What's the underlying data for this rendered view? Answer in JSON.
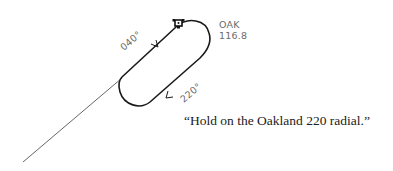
{
  "diagram": {
    "type": "holding-pattern",
    "station": {
      "id": "OAK",
      "frequency": "116.8",
      "icon": "vor-station-icon"
    },
    "radials": {
      "inbound_label": "040°",
      "outbound_label": "220°"
    },
    "caption": "“Hold on the Oakland 220 radial.”",
    "colors": {
      "track": "#1a1a1a",
      "radial_line": "#555555",
      "label_text": "#6b6b6b",
      "caption_text": "#222222"
    }
  }
}
